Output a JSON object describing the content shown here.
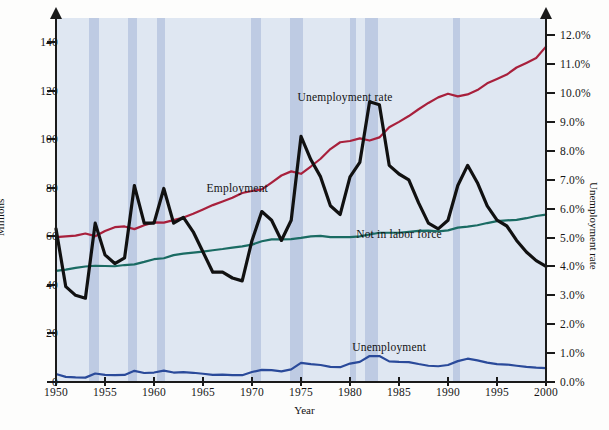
{
  "chart_data": {
    "type": "line",
    "title": "",
    "xlabel": "Year",
    "ylabel": "Millions",
    "y2label": "Unemployment rate",
    "xlim": [
      1950,
      2000
    ],
    "ylim": [
      0,
      150
    ],
    "y2lim": [
      0.0,
      12.6
    ],
    "grid": false,
    "legend_position": "inline-annotations",
    "xticks": [
      "1950",
      "1955",
      "1960",
      "1965",
      "1970",
      "1975",
      "1980",
      "1985",
      "1990",
      "1995",
      "2000"
    ],
    "xtick_values": [
      1950,
      1955,
      1960,
      1965,
      1970,
      1975,
      1980,
      1985,
      1990,
      1995,
      2000
    ],
    "yticks_left": [
      "0",
      "20",
      "40",
      "60",
      "80",
      "100",
      "120",
      "140"
    ],
    "ytick_values_left": [
      0,
      20,
      40,
      60,
      80,
      100,
      120,
      140
    ],
    "yticks_right": [
      "0.0%",
      "1.0%",
      "2.0%",
      "3.0%",
      "4.0%",
      "5.0%",
      "6.0%",
      "7.0%",
      "8.0%",
      "9.0%",
      "10.0%",
      "11.0%",
      "12.0%"
    ],
    "ytick_values_right": [
      0,
      1,
      2,
      3,
      4,
      5,
      6,
      7,
      8,
      9,
      10,
      11,
      12
    ],
    "annotations": [
      {
        "text": "Employment",
        "x": 1968.5,
        "y_px": 188
      },
      {
        "text": "Unemployment rate",
        "x": 1979.5,
        "y_px": 97
      },
      {
        "text": "Not in labor force",
        "x": 1985.0,
        "y_px": 234
      },
      {
        "text": "Unemployment",
        "x": 1984.0,
        "y_px": 347
      }
    ],
    "recession_bands": [
      {
        "start": 1953.4,
        "end": 1954.4
      },
      {
        "start": 1957.3,
        "end": 1958.3
      },
      {
        "start": 1960.3,
        "end": 1961.1
      },
      {
        "start": 1969.9,
        "end": 1970.9
      },
      {
        "start": 1973.9,
        "end": 1975.2
      },
      {
        "start": 1980.0,
        "end": 1980.6
      },
      {
        "start": 1981.5,
        "end": 1982.9
      },
      {
        "start": 1990.5,
        "end": 1991.2
      }
    ],
    "x": [
      1950,
      1951,
      1952,
      1953,
      1954,
      1955,
      1956,
      1957,
      1958,
      1959,
      1960,
      1961,
      1962,
      1963,
      1964,
      1965,
      1966,
      1967,
      1968,
      1969,
      1970,
      1971,
      1972,
      1973,
      1974,
      1975,
      1976,
      1977,
      1978,
      1979,
      1980,
      1981,
      1982,
      1983,
      1984,
      1985,
      1986,
      1987,
      1988,
      1989,
      1990,
      1991,
      1992,
      1993,
      1994,
      1995,
      1996,
      1997,
      1998,
      1999,
      2000
    ],
    "series": [
      {
        "name": "Employment",
        "color": "#a8203c",
        "axis": "left",
        "unit": "millions",
        "values": [
          59.7,
          60.0,
          60.3,
          61.2,
          60.1,
          62.2,
          63.8,
          64.1,
          63.0,
          64.6,
          65.8,
          65.7,
          66.7,
          67.8,
          69.3,
          71.1,
          72.9,
          74.4,
          75.9,
          77.9,
          78.7,
          79.4,
          82.2,
          85.1,
          86.8,
          85.8,
          88.8,
          92.0,
          96.0,
          98.8,
          99.3,
          100.4,
          99.5,
          100.8,
          105.0,
          107.2,
          109.6,
          112.4,
          115.0,
          117.3,
          118.8,
          117.7,
          118.5,
          120.3,
          123.1,
          124.9,
          126.7,
          129.6,
          131.5,
          133.5,
          138.2
        ]
      },
      {
        "name": "Not in labor force",
        "color": "#1a6b63",
        "axis": "left",
        "unit": "millions",
        "values": [
          45.8,
          46.3,
          47.0,
          47.6,
          47.9,
          47.8,
          47.7,
          48.2,
          48.5,
          49.5,
          50.6,
          51.0,
          52.3,
          52.9,
          53.3,
          53.7,
          54.3,
          54.8,
          55.4,
          55.9,
          56.6,
          58.0,
          58.8,
          58.8,
          58.9,
          59.4,
          60.0,
          60.2,
          59.7,
          59.7,
          59.7,
          60.0,
          60.8,
          61.5,
          61.5,
          61.5,
          61.9,
          62.3,
          62.4,
          62.1,
          62.5,
          63.6,
          64.0,
          64.6,
          65.5,
          66.3,
          66.6,
          66.8,
          67.5,
          68.4,
          69.0
        ]
      },
      {
        "name": "Unemployment",
        "color": "#2a4a9a",
        "axis": "left",
        "unit": "millions",
        "values": [
          3.3,
          2.1,
          1.9,
          1.8,
          3.5,
          2.9,
          2.8,
          2.9,
          4.6,
          3.7,
          3.9,
          4.7,
          3.9,
          4.1,
          3.8,
          3.4,
          2.9,
          3.0,
          2.8,
          2.8,
          4.1,
          5.0,
          4.9,
          4.4,
          5.2,
          7.9,
          7.4,
          7.0,
          6.2,
          6.1,
          7.6,
          8.3,
          10.7,
          10.7,
          8.5,
          8.3,
          8.2,
          7.4,
          6.7,
          6.5,
          7.0,
          8.6,
          9.6,
          8.9,
          8.0,
          7.4,
          7.2,
          6.7,
          6.2,
          5.9,
          5.7
        ]
      },
      {
        "name": "Unemployment rate",
        "color": "#111111",
        "axis": "right",
        "unit": "percent",
        "values": [
          5.3,
          3.3,
          3.0,
          2.9,
          5.5,
          4.4,
          4.1,
          4.3,
          6.8,
          5.5,
          5.5,
          6.7,
          5.5,
          5.7,
          5.2,
          4.5,
          3.8,
          3.8,
          3.6,
          3.5,
          4.9,
          5.9,
          5.6,
          4.9,
          5.6,
          8.5,
          7.7,
          7.1,
          6.1,
          5.8,
          7.1,
          7.6,
          9.7,
          9.6,
          7.5,
          7.2,
          7.0,
          6.2,
          5.5,
          5.3,
          5.6,
          6.8,
          7.5,
          6.9,
          6.1,
          5.6,
          5.4,
          4.9,
          4.5,
          4.2,
          4.0
        ]
      }
    ]
  },
  "colors": {
    "plot_background": "#dfe7f2",
    "recession_band": "#b9c6e0",
    "axis": "#1a1a1a",
    "employment": "#a8203c",
    "not_in_labor_force": "#1a6b63",
    "unemployment": "#2a4a9a",
    "unemployment_rate": "#111111"
  }
}
